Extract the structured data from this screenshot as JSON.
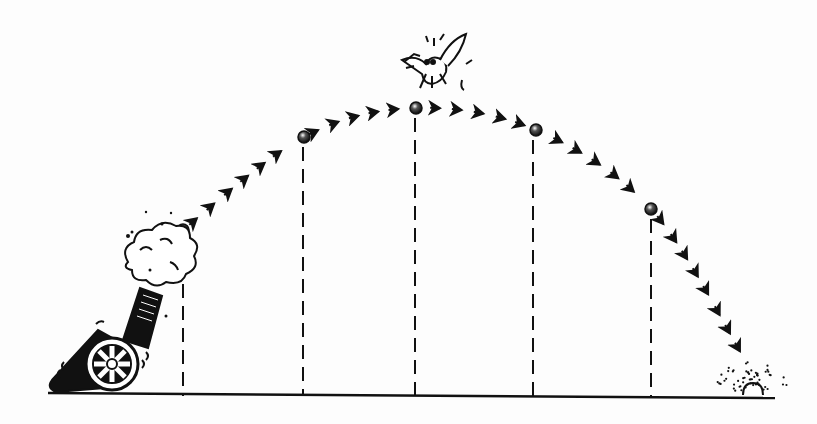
{
  "diagram": {
    "colors": {
      "ink": "#111111",
      "background": "#fdfdfd"
    },
    "ground": {
      "y": 396,
      "x_start": 48,
      "x_end": 775
    },
    "cannon": {
      "x": 110,
      "y": 360,
      "label": "cannon firing"
    },
    "balls": [
      {
        "x": 183,
        "y": 230
      },
      {
        "x": 304,
        "y": 137
      },
      {
        "x": 416,
        "y": 108
      },
      {
        "x": 536,
        "y": 130
      },
      {
        "x": 651,
        "y": 209
      }
    ],
    "drop_lines": [
      183,
      303,
      415,
      533,
      651
    ],
    "bird": {
      "x": 437,
      "y": 55,
      "label": "startled bird at apex"
    },
    "impact": {
      "x": 752,
      "y": 393,
      "label": "impact splash"
    }
  }
}
